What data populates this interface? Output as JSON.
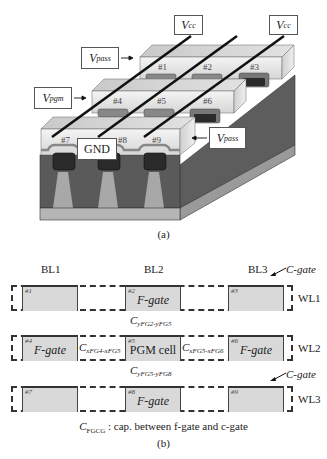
{
  "figure_a": {
    "caption": "(a)",
    "voltage_labels": {
      "vcc_left": {
        "main": "V",
        "sub": "cc"
      },
      "vcc_right": {
        "main": "V",
        "sub": "cc"
      },
      "vpass_top": {
        "main": "V",
        "sub": "pass"
      },
      "vpgm": {
        "main": "V",
        "sub": "pgm"
      },
      "vpass_bottom": {
        "main": "V",
        "sub": "pass"
      },
      "gnd": "GND"
    },
    "cells": [
      "#1",
      "#2",
      "#3",
      "#4",
      "#5",
      "#6",
      "#7",
      "#8",
      "#9"
    ],
    "colors": {
      "wordline_top": "#d4d4d4",
      "wordline_front": "#e6e6e6",
      "substrate": "#5a5a5a",
      "floating_gate": "#2a2a2a",
      "isolation": "#a8a8a8",
      "base": "#b5b5b5",
      "bitline": "#111111"
    }
  },
  "figure_b": {
    "caption": "(b)",
    "bitlines": [
      "BL1",
      "BL2",
      "BL3"
    ],
    "wordlines": [
      "WL1",
      "WL2",
      "WL3"
    ],
    "c_gate_label": "C-gate",
    "rows": [
      {
        "cells": [
          {
            "num": "#1",
            "text": ""
          },
          {
            "num": "#2",
            "text": "F-gate"
          },
          {
            "num": "#3",
            "text": ""
          }
        ]
      },
      {
        "cells": [
          {
            "num": "#4",
            "text": "F-gate"
          },
          {
            "num": "#5",
            "text": "PGM cell"
          },
          {
            "num": "#6",
            "text": "F-gate"
          }
        ]
      },
      {
        "cells": [
          {
            "num": "#7",
            "text": ""
          },
          {
            "num": "#8",
            "text": "F-gate"
          },
          {
            "num": "#9",
            "text": ""
          }
        ]
      }
    ],
    "capacitances": {
      "y_fg2_fg5": {
        "main": "C",
        "sub": "yFG2-yFG5"
      },
      "y_fg5_fg8": {
        "main": "C",
        "sub": "yFG5-yFG8"
      },
      "x_fg4_fg5": {
        "main": "C",
        "sub": "xFG4-xFG5"
      },
      "x_fg5_fg6": {
        "main": "C",
        "sub": "xFG5-xFG6"
      }
    },
    "legend": {
      "main": "C",
      "sub": "FGCG",
      "text": " : cap. between f-gate and c-gate"
    },
    "cell_fill": "#d9d9d9"
  }
}
